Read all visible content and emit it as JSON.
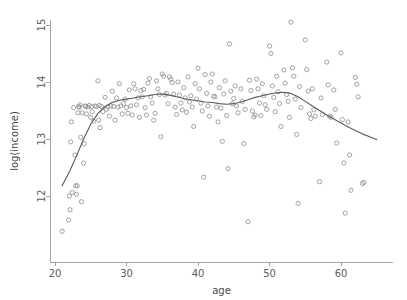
{
  "chart_data": {
    "type": "scatter",
    "title": "",
    "subtitle": "",
    "xlabel": "age",
    "ylabel": "log(income)",
    "xlim": [
      19.5,
      66.5
    ],
    "ylim": [
      11.3,
      15.2
    ],
    "xticks": [
      20,
      30,
      40,
      50,
      60
    ],
    "xticklabels": [
      "20",
      "30",
      "40",
      "50",
      "60"
    ],
    "yticks": [
      12,
      13,
      14,
      15
    ],
    "yticklabels": [
      "12",
      "13",
      "14",
      "15"
    ],
    "grid": false,
    "legend": null,
    "marker": "open-circle",
    "marker_color": "#8d8d8d",
    "curve_color": "#5a5a5a",
    "background_color": "#ffffff",
    "axis_color": "#9a9a9a",
    "series": [
      {
        "name": "observations",
        "type": "scatter",
        "points": [
          [
            21.0,
            11.38
          ],
          [
            21.9,
            11.58
          ],
          [
            22.0,
            12.0
          ],
          [
            22.1,
            11.76
          ],
          [
            22.2,
            12.95
          ],
          [
            22.3,
            13.3
          ],
          [
            22.4,
            12.06
          ],
          [
            22.6,
            13.55
          ],
          [
            22.8,
            12.72
          ],
          [
            22.9,
            12.18
          ],
          [
            23.0,
            12.03
          ],
          [
            23.1,
            12.18
          ],
          [
            23.2,
            13.46
          ],
          [
            23.3,
            13.57
          ],
          [
            23.4,
            13.56
          ],
          [
            23.5,
            13.6
          ],
          [
            23.6,
            13.03
          ],
          [
            23.7,
            11.9
          ],
          [
            23.8,
            13.46
          ],
          [
            24.0,
            12.58
          ],
          [
            24.1,
            12.92
          ],
          [
            24.2,
            13.58
          ],
          [
            24.3,
            13.57
          ],
          [
            24.4,
            13.44
          ],
          [
            24.6,
            13.56
          ],
          [
            24.8,
            13.59
          ],
          [
            25.0,
            13.38
          ],
          [
            25.1,
            13.57
          ],
          [
            25.2,
            13.48
          ],
          [
            25.4,
            13.31
          ],
          [
            25.6,
            13.58
          ],
          [
            25.8,
            13.57
          ],
          [
            26.0,
            14.02
          ],
          [
            26.1,
            13.33
          ],
          [
            26.2,
            13.59
          ],
          [
            26.3,
            13.2
          ],
          [
            26.5,
            13.57
          ],
          [
            26.7,
            13.48
          ],
          [
            27.0,
            13.73
          ],
          [
            27.2,
            13.52
          ],
          [
            27.4,
            13.56
          ],
          [
            27.6,
            13.4
          ],
          [
            27.8,
            13.58
          ],
          [
            28.0,
            13.84
          ],
          [
            28.2,
            13.57
          ],
          [
            28.4,
            13.33
          ],
          [
            28.6,
            13.72
          ],
          [
            28.8,
            13.56
          ],
          [
            29.0,
            13.97
          ],
          [
            29.2,
            13.58
          ],
          [
            29.4,
            13.44
          ],
          [
            29.6,
            13.62
          ],
          [
            29.8,
            13.7
          ],
          [
            30.0,
            13.55
          ],
          [
            30.2,
            13.45
          ],
          [
            30.4,
            13.86
          ],
          [
            30.6,
            13.58
          ],
          [
            30.8,
            13.42
          ],
          [
            31.0,
            13.97
          ],
          [
            31.2,
            13.88
          ],
          [
            31.4,
            13.6
          ],
          [
            31.6,
            13.72
          ],
          [
            31.8,
            13.38
          ],
          [
            32.0,
            13.85
          ],
          [
            32.2,
            13.74
          ],
          [
            32.4,
            13.87
          ],
          [
            32.6,
            13.55
          ],
          [
            32.8,
            13.42
          ],
          [
            33.0,
            13.98
          ],
          [
            33.2,
            14.06
          ],
          [
            33.4,
            13.74
          ],
          [
            33.6,
            13.63
          ],
          [
            33.8,
            13.33
          ],
          [
            34.0,
            13.45
          ],
          [
            34.2,
            14.02
          ],
          [
            34.4,
            13.88
          ],
          [
            34.6,
            13.78
          ],
          [
            34.8,
            13.04
          ],
          [
            35.0,
            14.14
          ],
          [
            35.2,
            14.1
          ],
          [
            35.4,
            13.77
          ],
          [
            35.6,
            13.8
          ],
          [
            35.8,
            13.62
          ],
          [
            36.0,
            14.09
          ],
          [
            36.2,
            14.05
          ],
          [
            36.4,
            13.99
          ],
          [
            36.6,
            13.79
          ],
          [
            36.8,
            13.56
          ],
          [
            37.0,
            13.43
          ],
          [
            37.2,
            14.0
          ],
          [
            37.4,
            13.77
          ],
          [
            37.6,
            13.63
          ],
          [
            37.8,
            13.51
          ],
          [
            38.0,
            13.9
          ],
          [
            38.2,
            13.72
          ],
          [
            38.4,
            13.47
          ],
          [
            38.6,
            14.09
          ],
          [
            38.8,
            13.65
          ],
          [
            39.0,
            13.76
          ],
          [
            39.2,
            13.56
          ],
          [
            39.4,
            13.22
          ],
          [
            39.6,
            13.97
          ],
          [
            39.8,
            13.7
          ],
          [
            40.0,
            14.24
          ],
          [
            40.2,
            13.88
          ],
          [
            40.4,
            13.63
          ],
          [
            40.6,
            13.49
          ],
          [
            40.8,
            12.33
          ],
          [
            41.0,
            14.13
          ],
          [
            41.2,
            13.8
          ],
          [
            41.4,
            13.58
          ],
          [
            41.6,
            13.4
          ],
          [
            41.8,
            14.0
          ],
          [
            42.0,
            14.14
          ],
          [
            42.2,
            13.75
          ],
          [
            42.4,
            13.74
          ],
          [
            42.6,
            13.56
          ],
          [
            42.8,
            13.3
          ],
          [
            43.0,
            13.9
          ],
          [
            43.2,
            13.54
          ],
          [
            43.4,
            12.96
          ],
          [
            43.6,
            13.79
          ],
          [
            43.8,
            14.02
          ],
          [
            44.0,
            13.41
          ],
          [
            44.2,
            12.48
          ],
          [
            44.4,
            14.67
          ],
          [
            44.6,
            13.84
          ],
          [
            44.8,
            13.62
          ],
          [
            45.0,
            13.71
          ],
          [
            45.2,
            13.93
          ],
          [
            45.4,
            13.58
          ],
          [
            45.6,
            13.46
          ],
          [
            46.0,
            13.88
          ],
          [
            46.2,
            13.66
          ],
          [
            46.4,
            12.92
          ],
          [
            46.6,
            13.52
          ],
          [
            47.0,
            11.55
          ],
          [
            47.2,
            14.03
          ],
          [
            47.4,
            13.85
          ],
          [
            47.6,
            13.49
          ],
          [
            47.8,
            13.39
          ],
          [
            48.0,
            13.42
          ],
          [
            48.2,
            14.05
          ],
          [
            48.4,
            13.88
          ],
          [
            48.6,
            13.63
          ],
          [
            48.8,
            13.41
          ],
          [
            49.0,
            13.97
          ],
          [
            49.2,
            13.76
          ],
          [
            49.4,
            13.6
          ],
          [
            49.6,
            13.52
          ],
          [
            50.0,
            14.63
          ],
          [
            50.2,
            14.5
          ],
          [
            50.4,
            13.93
          ],
          [
            50.6,
            13.73
          ],
          [
            50.8,
            13.48
          ],
          [
            51.0,
            14.1
          ],
          [
            51.2,
            13.83
          ],
          [
            51.4,
            13.62
          ],
          [
            51.6,
            13.22
          ],
          [
            52.0,
            14.21
          ],
          [
            52.2,
            13.98
          ],
          [
            52.4,
            13.78
          ],
          [
            52.6,
            13.66
          ],
          [
            52.8,
            13.38
          ],
          [
            53.0,
            15.05
          ],
          [
            53.2,
            14.25
          ],
          [
            53.4,
            14.1
          ],
          [
            53.6,
            13.7
          ],
          [
            53.8,
            13.08
          ],
          [
            54.0,
            11.87
          ],
          [
            54.2,
            13.92
          ],
          [
            54.4,
            13.55
          ],
          [
            55.0,
            14.74
          ],
          [
            55.2,
            14.22
          ],
          [
            55.4,
            13.84
          ],
          [
            55.6,
            13.44
          ],
          [
            55.8,
            13.36
          ],
          [
            56.0,
            13.88
          ],
          [
            56.2,
            13.51
          ],
          [
            56.4,
            13.4
          ],
          [
            57.0,
            12.25
          ],
          [
            57.2,
            13.72
          ],
          [
            57.4,
            13.43
          ],
          [
            58.0,
            14.35
          ],
          [
            58.2,
            13.95
          ],
          [
            58.4,
            13.4
          ],
          [
            58.6,
            13.38
          ],
          [
            59.0,
            13.86
          ],
          [
            59.2,
            13.52
          ],
          [
            59.4,
            12.93
          ],
          [
            60.0,
            14.51
          ],
          [
            60.2,
            13.34
          ],
          [
            60.4,
            12.58
          ],
          [
            60.6,
            11.7
          ],
          [
            61.0,
            13.3
          ],
          [
            61.2,
            12.72
          ],
          [
            61.4,
            12.1
          ],
          [
            62.0,
            14.08
          ],
          [
            62.2,
            13.96
          ],
          [
            62.4,
            13.74
          ],
          [
            63.0,
            12.22
          ],
          [
            63.2,
            12.24
          ]
        ]
      },
      {
        "name": "loess-smooth",
        "type": "line",
        "points": [
          [
            21.0,
            12.18
          ],
          [
            22.0,
            12.42
          ],
          [
            23.0,
            12.7
          ],
          [
            24.0,
            13.0
          ],
          [
            25.0,
            13.26
          ],
          [
            26.0,
            13.45
          ],
          [
            27.0,
            13.57
          ],
          [
            28.0,
            13.64
          ],
          [
            29.0,
            13.68
          ],
          [
            30.0,
            13.7
          ],
          [
            31.0,
            13.72
          ],
          [
            32.0,
            13.74
          ],
          [
            33.0,
            13.76
          ],
          [
            34.0,
            13.78
          ],
          [
            35.0,
            13.79
          ],
          [
            36.0,
            13.77
          ],
          [
            37.0,
            13.74
          ],
          [
            38.0,
            13.71
          ],
          [
            39.0,
            13.69
          ],
          [
            40.0,
            13.67
          ],
          [
            41.0,
            13.65
          ],
          [
            42.0,
            13.64
          ],
          [
            43.0,
            13.62
          ],
          [
            44.0,
            13.61
          ],
          [
            45.0,
            13.62
          ],
          [
            46.0,
            13.65
          ],
          [
            47.0,
            13.69
          ],
          [
            48.0,
            13.73
          ],
          [
            49.0,
            13.76
          ],
          [
            50.0,
            13.79
          ],
          [
            51.0,
            13.81
          ],
          [
            52.0,
            13.82
          ],
          [
            53.0,
            13.8
          ],
          [
            54.0,
            13.74
          ],
          [
            55.0,
            13.66
          ],
          [
            56.0,
            13.58
          ],
          [
            57.0,
            13.5
          ],
          [
            58.0,
            13.42
          ],
          [
            59.0,
            13.35
          ],
          [
            60.0,
            13.28
          ],
          [
            61.0,
            13.21
          ],
          [
            62.0,
            13.15
          ],
          [
            63.0,
            13.09
          ],
          [
            64.0,
            13.04
          ],
          [
            65.0,
            12.99
          ]
        ]
      }
    ]
  }
}
